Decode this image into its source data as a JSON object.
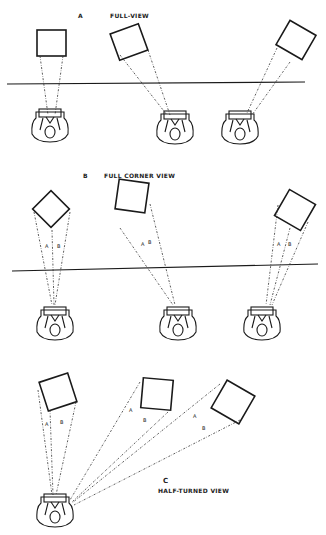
{
  "sections": [
    {
      "letter": "A",
      "title": "FULL-VIEW"
    },
    {
      "letter": "B",
      "title": "FULL CORNER VIEW"
    },
    {
      "letter": "C",
      "title": "HALF-TURNED VIEW"
    }
  ],
  "angle_labels": {
    "a": "A",
    "b": "B"
  }
}
